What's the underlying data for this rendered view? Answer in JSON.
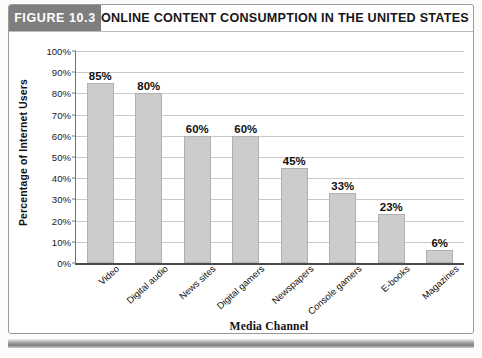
{
  "figure": {
    "badge": "FIGURE 10.3",
    "title": "ONLINE CONTENT CONSUMPTION IN THE UNITED STATES"
  },
  "chart_data": {
    "type": "bar",
    "title": "ONLINE CONTENT CONSUMPTION IN THE UNITED STATES",
    "xlabel": "Media Channel",
    "ylabel": "Percentage of Internet Users",
    "categories": [
      "Video",
      "Digital audio",
      "News sites",
      "Digital gamers",
      "Newspapers",
      "Console gamers",
      "E-books",
      "Magazines"
    ],
    "values": [
      85,
      80,
      60,
      60,
      45,
      33,
      23,
      6
    ],
    "value_labels": [
      "85%",
      "80%",
      "60%",
      "60%",
      "45%",
      "33%",
      "23%",
      "6%"
    ],
    "ylim": [
      0,
      100
    ],
    "ytick_labels": [
      "100%",
      "90%",
      "80%",
      "70%",
      "60%",
      "50%",
      "40%",
      "30%",
      "20%",
      "10%",
      "0%"
    ],
    "ytick_values": [
      100,
      90,
      80,
      70,
      60,
      50,
      40,
      30,
      20,
      10,
      0
    ],
    "grid": true,
    "legend": "none",
    "bar_color": "#cccccc",
    "bar_border_color": "#b0b0b0",
    "axis_color": "#4a4a4a",
    "gridline_color": "#c9c9c9",
    "badge_color": "#7e7e7e"
  }
}
